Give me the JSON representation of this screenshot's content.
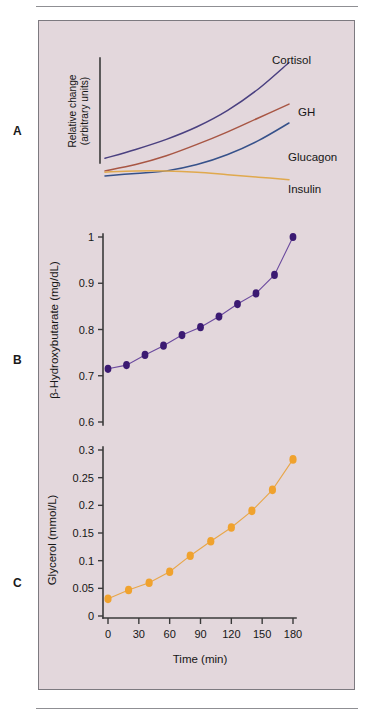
{
  "figure": {
    "background_color": "#e3d7dc",
    "border_color": "#7d7a80",
    "panels": [
      "A",
      "B",
      "C"
    ]
  },
  "panel_labels": {
    "a": "A",
    "b": "B",
    "c": "C"
  },
  "chart_data": [
    {
      "id": "panel-a",
      "type": "line",
      "title": "",
      "xlabel": "",
      "ylabel_line1": "Relative change",
      "ylabel_line2": "(arbitrary units)",
      "xlim": [
        0,
        180
      ],
      "ylim": [
        0,
        1
      ],
      "grid": false,
      "axis_ticks_shown": false,
      "legend": "inline-labels-right",
      "series": [
        {
          "name": "Cortisol",
          "color": "#4a4080",
          "label": "Cortisol",
          "x": [
            0,
            30,
            60,
            90,
            120,
            150,
            180
          ],
          "values": [
            0.22,
            0.29,
            0.37,
            0.47,
            0.6,
            0.77,
            0.98
          ]
        },
        {
          "name": "GH",
          "color": "#a85644",
          "label": "GH",
          "x": [
            0,
            30,
            60,
            90,
            120,
            150,
            180
          ],
          "values": [
            0.12,
            0.17,
            0.24,
            0.33,
            0.43,
            0.54,
            0.65
          ]
        },
        {
          "name": "Glucagon",
          "color": "#36518a",
          "label": "Glucagon",
          "x": [
            0,
            30,
            60,
            90,
            120,
            150,
            180
          ],
          "values": [
            0.08,
            0.1,
            0.12,
            0.17,
            0.25,
            0.36,
            0.5
          ]
        },
        {
          "name": "Insulin",
          "color": "#e0a94e",
          "label": "Insulin",
          "x": [
            0,
            30,
            60,
            90,
            120,
            150,
            180
          ],
          "values": [
            0.11,
            0.12,
            0.12,
            0.11,
            0.09,
            0.07,
            0.05
          ]
        }
      ]
    },
    {
      "id": "panel-b",
      "type": "line",
      "title": "",
      "xlabel": "",
      "ylabel": "β-Hydroxybutarate (mg/dL)",
      "marker": "filled-circle",
      "marker_color": "#3b1a72",
      "line_color": "#6b4a9e",
      "ylim": [
        0.6,
        1.0
      ],
      "yticks": [
        0.6,
        0.7,
        0.8,
        0.9,
        1
      ],
      "ytick_labels": [
        "0.6",
        "0.7",
        "0.8",
        "0.9",
        "1"
      ],
      "xlim": [
        0,
        180
      ],
      "grid": false,
      "x": [
        0,
        20,
        40,
        60,
        80,
        100,
        120,
        140,
        160,
        180
      ],
      "values": [
        0.715,
        0.723,
        0.745,
        0.765,
        0.788,
        0.805,
        0.828,
        0.855,
        0.878,
        0.918,
        1.0
      ]
    },
    {
      "id": "panel-c",
      "type": "line",
      "title": "",
      "xlabel": "Time (min)",
      "ylabel": "Glycerol (mmol/L)",
      "marker": "filled-circle",
      "marker_color": "#f0a22e",
      "line_color": "#e8a64a",
      "ylim": [
        0,
        0.3
      ],
      "yticks": [
        0,
        0.05,
        0.1,
        0.15,
        0.2,
        0.25,
        0.3
      ],
      "ytick_labels": [
        "0",
        "0.05",
        "0.1",
        "0.15",
        "0.2",
        "0.25",
        "0.3"
      ],
      "xlim": [
        0,
        180
      ],
      "xticks": [
        0,
        30,
        60,
        90,
        120,
        150,
        180
      ],
      "xtick_labels": [
        "0",
        "30",
        "60",
        "90",
        "120",
        "150",
        "180"
      ],
      "grid": false,
      "x": [
        0,
        20,
        40,
        60,
        80,
        100,
        120,
        140,
        160,
        180
      ],
      "values": [
        0.031,
        0.047,
        0.06,
        0.08,
        0.109,
        0.135,
        0.16,
        0.19,
        0.228,
        0.283
      ]
    }
  ]
}
